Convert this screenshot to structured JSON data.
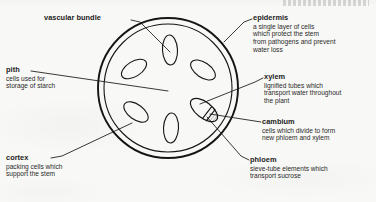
{
  "diagram": {
    "colors": {
      "ink": "#1c1c1c",
      "paper": "#f8f8f6",
      "stroke": "#151515"
    },
    "labels": [
      {
        "key": "vascular_bundle",
        "heading": "vascular bundle",
        "body": []
      },
      {
        "key": "epidermis",
        "heading": "epidermis",
        "body": [
          "a single layer of cells",
          "which protect the stem",
          "from pathogens and prevent",
          "water loss"
        ]
      },
      {
        "key": "pith",
        "heading": "pith",
        "body": [
          "cells used for",
          "storage of starch"
        ]
      },
      {
        "key": "xylem",
        "heading": "xylem",
        "body": [
          "lignified tubes which",
          "transport water throughout",
          "the plant"
        ]
      },
      {
        "key": "cambium",
        "heading": "cambium",
        "body": [
          "cells which divide to form",
          "new phloem and xylem"
        ]
      },
      {
        "key": "cortex",
        "heading": "cortex",
        "body": [
          "packing cells which",
          "support the stem"
        ]
      },
      {
        "key": "phloem",
        "heading": "phloem",
        "body": [
          "sieve-tube elements which",
          "transport sucrose"
        ]
      }
    ],
    "structures": [
      {
        "key": "epidermis-outer-ring",
        "shape": "circle",
        "cx": 168,
        "cy": 88,
        "r": 70
      },
      {
        "key": "epidermis-inner-ring",
        "shape": "circle",
        "cx": 168,
        "cy": 88,
        "r": 64
      },
      {
        "key": "vascular-bundle-top",
        "shape": "ellipse",
        "cx": 170,
        "cy": 50,
        "rx": 7.5,
        "ry": 15,
        "rotate": -3
      },
      {
        "key": "vascular-bundle-upper-left",
        "shape": "ellipse",
        "cx": 134,
        "cy": 69,
        "rx": 7.5,
        "ry": 14,
        "rotate": 58
      },
      {
        "key": "vascular-bundle-upper-right",
        "shape": "ellipse",
        "cx": 203,
        "cy": 70,
        "rx": 7.5,
        "ry": 14,
        "rotate": -56
      },
      {
        "key": "vascular-bundle-lower-left",
        "shape": "ellipse",
        "cx": 136,
        "cy": 112,
        "rx": 7.5,
        "ry": 14,
        "rotate": -54
      },
      {
        "key": "vascular-bundle-bottom",
        "shape": "ellipse",
        "cx": 171,
        "cy": 128,
        "rx": 7.5,
        "ry": 15,
        "rotate": 3
      },
      {
        "key": "vascular-bundle-detailed",
        "shape": "ellipse",
        "cx": 204,
        "cy": 110,
        "rx": 8,
        "ry": 16,
        "rotate": -52,
        "zones": [
          "xylem",
          "cambium",
          "phloem"
        ]
      }
    ]
  }
}
